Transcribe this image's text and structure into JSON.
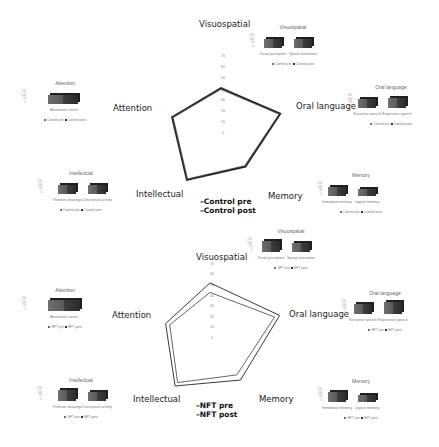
{
  "chart_data": [
    {
      "type": "radar",
      "title": "",
      "axes": [
        "Visuospatial",
        "Oral language",
        "Memory",
        "Intellectual",
        "Attention"
      ],
      "ticks": [
        0,
        10,
        20,
        30,
        40,
        50,
        60,
        70
      ],
      "rlim": [
        0,
        70
      ],
      "series": [
        {
          "name": "Control pre",
          "values": [
            40,
            56,
            37,
            52,
            46
          ]
        },
        {
          "name": "Control post",
          "values": [
            41,
            57,
            38,
            53,
            47
          ]
        }
      ],
      "legend_position": "bottom-center"
    },
    {
      "type": "radar",
      "title": "",
      "axes": [
        "Visuospatial",
        "Oral language",
        "Memory",
        "Intellectual",
        "Attention"
      ],
      "ticks": [
        0,
        10,
        20,
        30,
        40,
        50,
        60,
        70
      ],
      "rlim": [
        0,
        70
      ],
      "series": [
        {
          "name": "NFT pre",
          "values": [
            43,
            64,
            43,
            52,
            40
          ]
        },
        {
          "name": "NFT post",
          "values": [
            52,
            69,
            49,
            56,
            44
          ]
        }
      ],
      "legend_position": "bottom-center"
    },
    {
      "type": "bar",
      "title": "Attention",
      "categories": [
        "Attentional control"
      ],
      "series": [
        {
          "name": "Control pre",
          "values": [
            100
          ]
        },
        {
          "name": "Control post",
          "values": [
            100
          ]
        }
      ],
      "yticks": [
        0,
        50,
        100,
        150
      ]
    },
    {
      "type": "bar",
      "title": "Visuospatial",
      "categories": [
        "Visual perception",
        "Spatial orientation"
      ],
      "series": [
        {
          "name": "Control pre",
          "values": [
            100,
            100
          ]
        },
        {
          "name": "Control post",
          "values": [
            100,
            100
          ]
        }
      ],
      "yticks": [
        0,
        50,
        100,
        150
      ]
    },
    {
      "type": "bar",
      "title": "Oral language",
      "categories": [
        "Receptive speech",
        "Expressive speech"
      ],
      "series": [
        {
          "name": "Control pre",
          "values": [
            100,
            110
          ]
        },
        {
          "name": "Control post",
          "values": [
            100,
            110
          ]
        }
      ],
      "yticks": [
        0,
        50,
        100,
        150
      ]
    },
    {
      "type": "bar",
      "title": "Memory",
      "categories": [
        "Immediate memory",
        "Logical memory"
      ],
      "series": [
        {
          "name": "Control pre",
          "values": [
            100,
            80
          ]
        },
        {
          "name": "Control post",
          "values": [
            100,
            80
          ]
        }
      ],
      "yticks": [
        0,
        50,
        100,
        150
      ]
    },
    {
      "type": "bar",
      "title": "Intellectual",
      "categories": [
        "Thematic drawings",
        "Conceptual activity"
      ],
      "series": [
        {
          "name": "Control pre",
          "values": [
            100,
            100
          ]
        },
        {
          "name": "Control post",
          "values": [
            100,
            100
          ]
        }
      ],
      "yticks": [
        0,
        50,
        100,
        150
      ]
    },
    {
      "type": "bar",
      "title": "Attention",
      "categories": [
        "Attentional control"
      ],
      "series": [
        {
          "name": "NFT pre",
          "values": [
            100
          ]
        },
        {
          "name": "NFT post",
          "values": [
            110
          ]
        }
      ],
      "yticks": [
        0,
        50,
        100,
        150
      ]
    },
    {
      "type": "bar",
      "title": "Visuospatial",
      "categories": [
        "Visual perception",
        "Spatial orientation"
      ],
      "series": [
        {
          "name": "NFT pre",
          "values": [
            100,
            90
          ]
        },
        {
          "name": "NFT post",
          "values": [
            110,
            100
          ]
        }
      ],
      "yticks": [
        0,
        50,
        100,
        150
      ]
    },
    {
      "type": "bar",
      "title": "Oral language",
      "categories": [
        "Receptive speech",
        "Expressive speech"
      ],
      "series": [
        {
          "name": "NFT pre",
          "values": [
            100,
            110
          ]
        },
        {
          "name": "NFT post",
          "values": [
            110,
            120
          ]
        }
      ],
      "yticks": [
        0,
        50,
        100,
        150
      ]
    },
    {
      "type": "bar",
      "title": "Memory",
      "categories": [
        "Immediate memory",
        "Logical memory"
      ],
      "series": [
        {
          "name": "NFT pre",
          "values": [
            100,
            80
          ]
        },
        {
          "name": "NFT post",
          "values": [
            110,
            90
          ]
        }
      ],
      "yticks": [
        0,
        50,
        100,
        150
      ]
    },
    {
      "type": "bar",
      "title": "Intellectual",
      "categories": [
        "Thematic drawings",
        "Conceptual activity"
      ],
      "series": [
        {
          "name": "NFT pre",
          "values": [
            100,
            90
          ]
        },
        {
          "name": "NFT post",
          "values": [
            110,
            100
          ]
        }
      ],
      "yticks": [
        0,
        50,
        100,
        150
      ]
    }
  ],
  "top": {
    "axis_labels": {
      "visuospatial": "Visuospatial",
      "oral": "Oral language",
      "memory": "Memory",
      "intellectual": "Intellectual",
      "attention": "Attention"
    },
    "legend": [
      "Control pre",
      "Control post"
    ],
    "mini": {
      "attention": {
        "title": "Attention",
        "cats": [
          "Attentional control"
        ],
        "legend": [
          "Control pre",
          "Control post"
        ]
      },
      "visuospatial": {
        "title": "Visuospatial",
        "cats": [
          "Visual perception",
          "Spatial orientation"
        ],
        "legend": [
          "Control pre",
          "Control post"
        ]
      },
      "oral": {
        "title": "Oral language",
        "cats": [
          "Receptive speech",
          "Expressive speech"
        ],
        "legend": [
          "Control pre",
          "Control post"
        ]
      },
      "memory": {
        "title": "Memory",
        "cats": [
          "Immediate memory",
          "Logical memory"
        ],
        "legend": [
          "Control pre",
          "Control post"
        ]
      },
      "intellectual": {
        "title": "Intellectual",
        "cats": [
          "Thematic drawings",
          "Conceptual activity"
        ],
        "legend": [
          "Control pre",
          "Control post"
        ]
      }
    }
  },
  "bottom": {
    "axis_labels": {
      "visuospatial": "Visuospatial",
      "oral": "Oral language",
      "memory": "Memory",
      "intellectual": "Intellectual",
      "attention": "Attention"
    },
    "legend": [
      "NFT pre",
      "NFT post"
    ],
    "mini": {
      "attention": {
        "title": "Attention",
        "cats": [
          "Attentional control"
        ],
        "legend": [
          "NFT pre",
          "NFT post"
        ]
      },
      "visuospatial": {
        "title": "Visuospatial",
        "cats": [
          "Visual perception",
          "Spatial orientation"
        ],
        "legend": [
          "NFT pre",
          "NFT post"
        ]
      },
      "oral": {
        "title": "Oral language",
        "cats": [
          "Receptive speech",
          "Expressive speech"
        ],
        "legend": [
          "NFT pre",
          "NFT post"
        ]
      },
      "memory": {
        "title": "Memory",
        "cats": [
          "Immediate memory",
          "Logical memory"
        ],
        "legend": [
          "NFT pre",
          "NFT post"
        ]
      },
      "intellectual": {
        "title": "Intellectual",
        "cats": [
          "Thematic drawings",
          "Conceptual activity"
        ],
        "legend": [
          "NFT pre",
          "NFT post"
        ]
      }
    }
  },
  "mini_yticks": [
    "150",
    "100",
    "50",
    "0"
  ],
  "colors": {
    "line_pre": "#555555",
    "line_post": "#222222",
    "bar_dark": "#2c2c2c",
    "bar_light": "#6f6f6f"
  }
}
